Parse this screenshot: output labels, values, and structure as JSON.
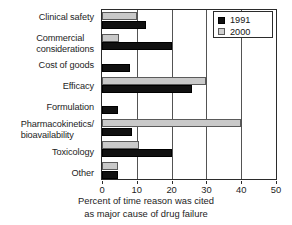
{
  "chart_data": {
    "type": "bar",
    "orientation": "horizontal",
    "title": "",
    "xlabel_lines": [
      "Percent of time reason was cited",
      "as major cause of drug failure"
    ],
    "ylabel": "",
    "xlim": [
      0,
      50
    ],
    "xticks": [
      0,
      10,
      20,
      30,
      40,
      50
    ],
    "xticklabels": [
      "0",
      "10",
      "20",
      "30",
      "40",
      "50"
    ],
    "grid": true,
    "grid_axis": "x",
    "legend_position": "top-right",
    "categories": [
      "Clinical safety",
      "Commercial considerations",
      "Cost of goods",
      "Efficacy",
      "Formulation",
      "Pharmacokinetics/bioavailability",
      "Toxicology",
      "Other"
    ],
    "category_label_lines": [
      [
        "Clinical safety"
      ],
      [
        "Commercial",
        "considerations"
      ],
      [
        "Cost of goods"
      ],
      [
        "Efficacy"
      ],
      [
        "Formulation"
      ],
      [
        "Pharmacokinetics/",
        "bioavailability"
      ],
      [
        "Toxicology"
      ],
      [
        "Other"
      ]
    ],
    "series": [
      {
        "name": "1991",
        "color": "#111111",
        "values": [
          12.5,
          20,
          8,
          26,
          4.5,
          8.5,
          20,
          4.5
        ]
      },
      {
        "name": "2000",
        "color": "#c9c9c9",
        "values": [
          10,
          5,
          0,
          30,
          0,
          40,
          10.5,
          4.5
        ]
      }
    ]
  },
  "legend": {
    "entries": [
      {
        "label": "1991",
        "swatch": "black-square-swatch"
      },
      {
        "label": "2000",
        "swatch": "gray-square-swatch"
      }
    ]
  },
  "axis": {
    "x_tick_labels": [
      "0",
      "10",
      "20",
      "30",
      "40",
      "50"
    ],
    "x_title_line1": "Percent of time reason was cited",
    "x_title_line2": "as major cause of drug failure"
  },
  "categories_text": {
    "c0_l0": "Clinical safety",
    "c1_l0": "Commercial",
    "c1_l1": "considerations",
    "c2_l0": "Cost of goods",
    "c3_l0": "Efficacy",
    "c4_l0": "Formulation",
    "c5_l0": "Pharmacokinetics/",
    "c5_l1": "bioavailability",
    "c6_l0": "Toxicology",
    "c7_l0": "Other"
  }
}
